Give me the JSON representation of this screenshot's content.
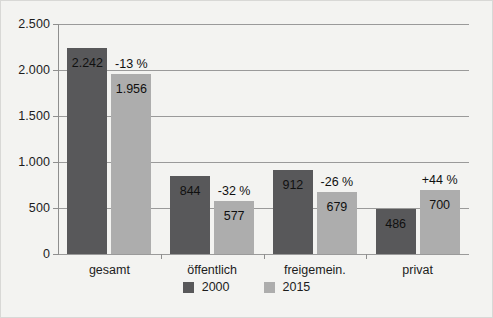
{
  "chart_data": {
    "type": "bar",
    "title": "",
    "subtitle": "",
    "xlabel": "",
    "ylabel": "",
    "ylim": [
      0,
      2500
    ],
    "ytick_labels": [
      "2.500",
      "2.000",
      "1.500",
      "1.000",
      "500",
      "0"
    ],
    "ytick_values": [
      2500,
      2000,
      1500,
      1000,
      500,
      0
    ],
    "grid": "horizontal",
    "legend_position": "bottom-center",
    "categories": [
      "gesamt",
      "öffentlich",
      "freigemein.",
      "privat"
    ],
    "series": [
      {
        "name": "2000",
        "color": "#58585a",
        "values": [
          2242,
          844,
          912,
          486
        ],
        "value_labels": [
          "2.242",
          "844",
          "912",
          "486"
        ]
      },
      {
        "name": "2015",
        "color": "#adadad",
        "values": [
          1956,
          577,
          679,
          700
        ],
        "value_labels": [
          "1.956",
          "577",
          "679",
          "700"
        ]
      }
    ],
    "annotations": {
      "change_labels": [
        "-13 %",
        "-32 %",
        "-26 %",
        "+44 %"
      ]
    }
  },
  "axis": {
    "ticks": [
      {
        "label": "2.500",
        "value": 2500
      },
      {
        "label": "2.000",
        "value": 2000
      },
      {
        "label": "1.500",
        "value": 1500
      },
      {
        "label": "1.000",
        "value": 1000
      },
      {
        "label": "500",
        "value": 500
      },
      {
        "label": "0",
        "value": 0
      }
    ]
  },
  "legend": {
    "items": [
      {
        "label": "2000",
        "color": "#58585a"
      },
      {
        "label": "2015",
        "color": "#adadad"
      }
    ]
  },
  "colors": {
    "series_2000": "#58585a",
    "series_2015": "#adadad",
    "grid": "#9a9a9a",
    "axis": "#8e8e8e",
    "background": "#f3f3f1",
    "text": "#1c1c1c"
  }
}
